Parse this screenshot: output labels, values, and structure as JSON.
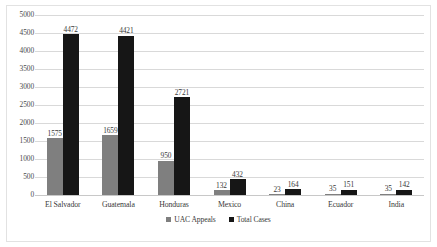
{
  "chart_data": {
    "type": "bar",
    "title": "",
    "subtitle": "",
    "xlabel": "",
    "ylabel": "",
    "categories": [
      "El Salvador",
      "Guatemala",
      "Honduras",
      "Mexico",
      "China",
      "Ecuador",
      "India"
    ],
    "series": [
      {
        "name": "UAC Appeals",
        "color": "#7f7f7f",
        "values": [
          1575,
          1659,
          950,
          132,
          23,
          35,
          35
        ]
      },
      {
        "name": "Total Cases",
        "color": "#161616",
        "values": [
          4472,
          4421,
          2721,
          432,
          164,
          151,
          142
        ]
      }
    ],
    "ylim": [
      0,
      5000
    ],
    "ytick_step": 500,
    "ytick_labels": [
      "5000",
      "4500",
      "4000",
      "3500",
      "3000",
      "2500",
      "2000",
      "1500",
      "1000",
      "500",
      "0"
    ],
    "ytick_values": [
      5000,
      4500,
      4000,
      3500,
      3000,
      2500,
      2000,
      1500,
      1000,
      500,
      0
    ],
    "grid": true,
    "grid_axis": "y",
    "legend_position": "bottom",
    "data_labels": true
  }
}
